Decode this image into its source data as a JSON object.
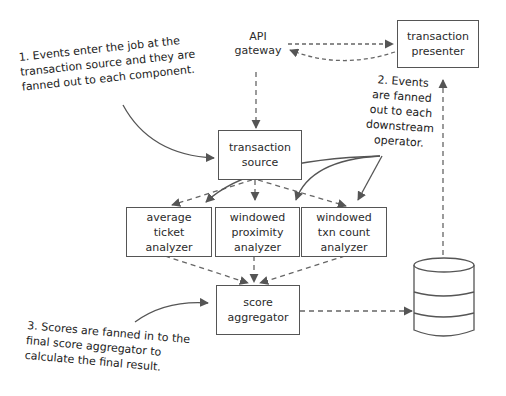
{
  "nodes": {
    "api_gateway": {
      "label": "API\ngateway"
    },
    "transaction_presenter": {
      "label": "transaction\npresenter"
    },
    "transaction_source": {
      "label": "transaction\nsource"
    },
    "average_ticket_analyzer": {
      "label": "average\nticket\nanalyzer"
    },
    "windowed_proximity_analyzer": {
      "label": "windowed\nproximity\nanalyzer"
    },
    "windowed_txn_count_analyzer": {
      "label": "windowed\ntxn count\nanalyzer"
    },
    "score_aggregator": {
      "label": "score\naggregator"
    },
    "database": {
      "label": ""
    }
  },
  "annotations": {
    "note1": "1. Events enter the job at the\ntransaction source and they are\nfanned out to each component.",
    "note2": "2. Events\nare fanned\nout to each\ndownstream\noperator.",
    "note3": "3. Scores are fanned in to the\nfinal score aggregator to\ncalculate the final result."
  },
  "colors": {
    "stroke": "#555555",
    "text": "#2b2b2b",
    "background": "#ffffff"
  }
}
